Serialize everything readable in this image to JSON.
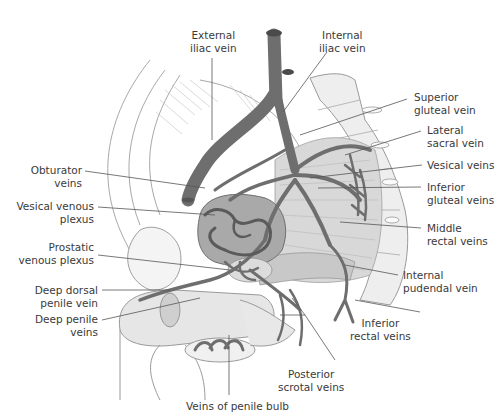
{
  "figure": {
    "colors": {
      "vein": "#6e6e6e",
      "vein_outline": "#4f4f4f",
      "bladder": "#a9a9a9",
      "muscle": "#d4d4d4",
      "outline": "#9a9a9a",
      "leader": "#555555",
      "text": "#3a3a3a",
      "background": "#ffffff"
    }
  },
  "labels": {
    "external_iliac_vein": {
      "line1": "External",
      "line2": "iliac vein"
    },
    "internal_iliac_vein": {
      "line1": "Internal",
      "line2": "iliac vein"
    },
    "superior_gluteal_vein": {
      "line1": "Superior",
      "line2": "gluteal vein"
    },
    "lateral_sacral_vein": {
      "line1": "Lateral",
      "line2": "sacral vein"
    },
    "vesical_veins": {
      "line1": "Vesical veins"
    },
    "inferior_gluteal_veins": {
      "line1": "Inferior",
      "line2": "gluteal veins"
    },
    "middle_rectal_veins": {
      "line1": "Middle",
      "line2": "rectal veins"
    },
    "internal_pudendal_vein": {
      "line1": "Internal",
      "line2": "pudendal vein"
    },
    "inferior_rectal_veins": {
      "line1": "Inferior",
      "line2": "rectal veins"
    },
    "posterior_scrotal_veins": {
      "line1": "Posterior",
      "line2": "scrotal veins"
    },
    "veins_of_penile_bulb": {
      "line1": "Veins of penile bulb"
    },
    "deep_penile_veins": {
      "line1": "Deep penile",
      "line2": "veins"
    },
    "deep_dorsal_penile_vein": {
      "line1": "Deep dorsal",
      "line2": "penile vein"
    },
    "prostatic_venous_plexus": {
      "line1": "Prostatic",
      "line2": "venous plexus"
    },
    "vesical_venous_plexus": {
      "line1": "Vesical venous",
      "line2": "plexus"
    },
    "obturator_veins": {
      "line1": "Obturator",
      "line2": "veins"
    }
  }
}
